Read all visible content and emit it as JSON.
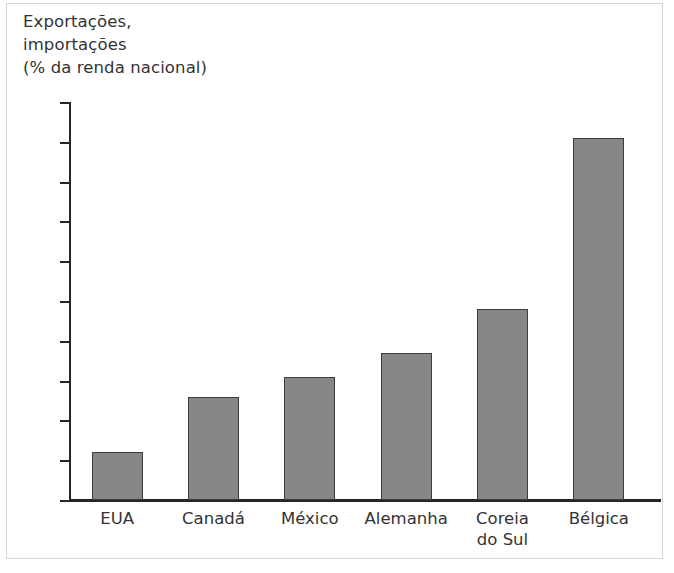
{
  "figure": {
    "axis_title": "Exportações,\nimportações\n(% da renda nacional)",
    "bar_color": "#878787",
    "bar_border_color": "#3c3c3c",
    "axis_color": "#262626"
  },
  "chart_data": {
    "type": "bar",
    "title": "Exportações, importações (% da renda nacional)",
    "xlabel": "",
    "ylabel": "Exportações, importações (% da renda nacional)",
    "categories": [
      "EUA",
      "Canadá",
      "México",
      "Alemanha",
      "Coreia\ndo Sul",
      "Bélgica"
    ],
    "values": [
      12,
      26,
      31,
      37,
      48,
      91
    ],
    "ylim": [
      0,
      100
    ],
    "yticks": [
      0,
      10,
      20,
      30,
      40,
      50,
      60,
      70,
      80,
      90,
      100
    ],
    "ytick_labels": [
      "0",
      "10",
      "20",
      "30",
      "40",
      "50",
      "60",
      "70",
      "80",
      "90",
      "100"
    ],
    "grid": false,
    "legend": null
  }
}
